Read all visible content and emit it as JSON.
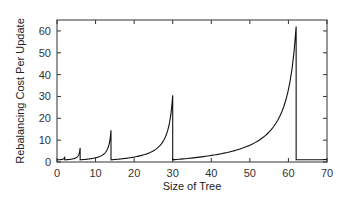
{
  "chart_data": {
    "type": "line",
    "title": "",
    "xlabel": "Size of Tree",
    "ylabel": "Rebalancing Cost Per Update",
    "xlim": [
      0,
      70
    ],
    "ylim": [
      0,
      65
    ],
    "xticks": [
      0,
      10,
      20,
      30,
      40,
      50,
      60,
      70
    ],
    "yticks": [
      0,
      10,
      20,
      30,
      40,
      50,
      60
    ],
    "grid": false,
    "legend": null,
    "series": [
      {
        "name": "rebalancing cost",
        "description": "Sawtooth curve; cost rises hyperbolically within each segment and drops sharply at sizes 2, 6, 14, 30, 62",
        "segments": [
          {
            "x_start": 0,
            "x_end": 2,
            "y_start": 1.0,
            "y_peak": 2.5
          },
          {
            "x_start": 2,
            "x_end": 6,
            "y_start": 1.0,
            "y_peak": 6.5
          },
          {
            "x_start": 6,
            "x_end": 14,
            "y_start": 1.0,
            "y_peak": 14.5
          },
          {
            "x_start": 14,
            "x_end": 30,
            "y_start": 1.0,
            "y_peak": 30.5
          },
          {
            "x_start": 30,
            "x_end": 62,
            "y_start": 1.0,
            "y_peak": 62.0
          },
          {
            "x_start": 62,
            "x_end": 70,
            "y_start": 1.0,
            "y_peak": 1.2
          }
        ]
      }
    ]
  }
}
